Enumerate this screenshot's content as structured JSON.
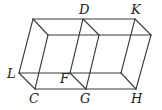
{
  "diagram": {
    "type": "two adjacent parallelepipeds (prisms) sharing face DFG",
    "colors": {
      "line": "#3a3a3a",
      "label": "#222222",
      "background": "#ffffff"
    },
    "vertices": {
      "back_top_left": [
        33,
        19
      ],
      "D": [
        83,
        19
      ],
      "K": [
        135,
        19
      ],
      "front_top_left": [
        48,
        35
      ],
      "front_top_mid": [
        99,
        35
      ],
      "front_top_right": [
        151,
        35
      ],
      "L": [
        19,
        73
      ],
      "F": [
        70,
        73
      ],
      "back_bottom_right": [
        121,
        73
      ],
      "C": [
        35,
        89
      ],
      "G": [
        86,
        89
      ],
      "H": [
        136,
        89
      ]
    },
    "labels": [
      {
        "text": "D",
        "x": 79,
        "y": 14
      },
      {
        "text": "K",
        "x": 131,
        "y": 14
      },
      {
        "text": "L",
        "x": 7,
        "y": 78
      },
      {
        "text": "F",
        "x": 60,
        "y": 83
      },
      {
        "text": "C",
        "x": 29,
        "y": 103
      },
      {
        "text": "G",
        "x": 80,
        "y": 103
      },
      {
        "text": "H",
        "x": 131,
        "y": 103
      }
    ]
  }
}
